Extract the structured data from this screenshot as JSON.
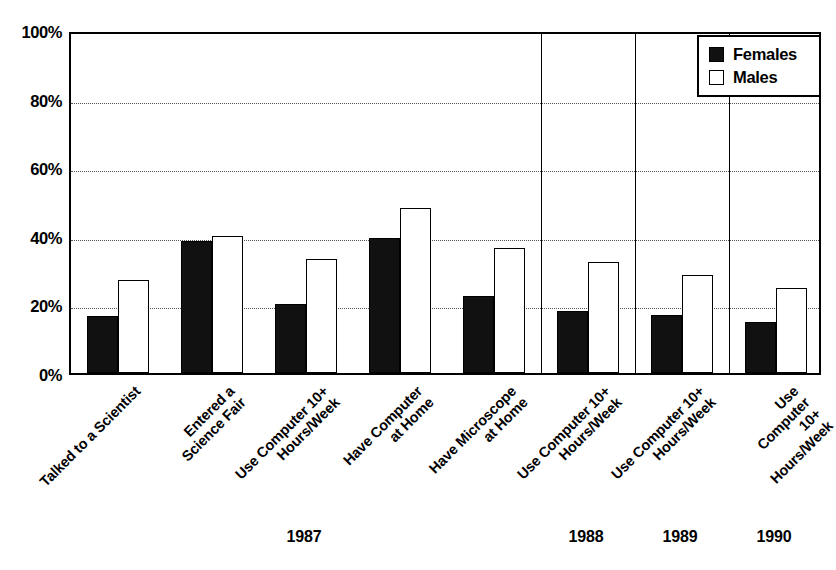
{
  "chart_data": {
    "type": "bar",
    "title": "",
    "subtitle": "",
    "xlabel": "",
    "ylabel": "",
    "ylim": [
      0,
      100
    ],
    "yticks": [
      "0%",
      "20%",
      "40%",
      "60%",
      "80%",
      "100%"
    ],
    "ytick_values": [
      0,
      20,
      40,
      60,
      80,
      100
    ],
    "grid": "horizontal-dotted",
    "legend_position": "top-right",
    "legend": [
      "Females",
      "Males"
    ],
    "categories": [
      "Talked to a Scientist",
      "Entered a\nScience Fair",
      "Use Computer 10+\nHours/Week",
      "Have Computer\nat Home",
      "Have Microscope\nat Home",
      "Use Computer 10+\nHours/Week",
      "Use Computer 10+\nHours/Week",
      "Use Computer 10+\nHours/Week"
    ],
    "series": [
      {
        "name": "Females",
        "color": "#111111",
        "values": [
          16.5,
          38.5,
          20.0,
          39.5,
          22.5,
          18.0,
          17.0,
          15.0
        ]
      },
      {
        "name": "Males",
        "color": "#ffffff",
        "values": [
          27.0,
          40.0,
          33.3,
          48.0,
          36.5,
          32.5,
          28.5,
          24.8
        ]
      }
    ],
    "group_labels": [
      "1987",
      "1988",
      "1989",
      "1990"
    ],
    "group_spans": [
      [
        0,
        4
      ],
      [
        5,
        5
      ],
      [
        6,
        6
      ],
      [
        7,
        7
      ]
    ]
  },
  "axis": {
    "ytick_0": "0%",
    "ytick_1": "20%",
    "ytick_2": "40%",
    "ytick_3": "60%",
    "ytick_4": "80%",
    "ytick_5": "100%"
  },
  "legend": {
    "females_label": "Females",
    "males_label": "Males"
  },
  "years": {
    "y1987": "1987",
    "y1988": "1988",
    "y1989": "1989",
    "y1990": "1990"
  }
}
